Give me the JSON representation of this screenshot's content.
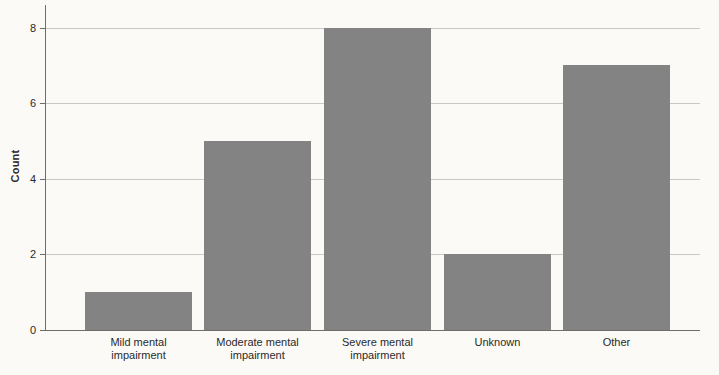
{
  "chart_data": {
    "type": "bar",
    "title": "",
    "xlabel": "",
    "ylabel": "Count",
    "categories": [
      "Mild mental impairment",
      "Moderate mental impairment",
      "Severe mental impairment",
      "Unknown",
      "Other"
    ],
    "category_lines": [
      [
        "Mild mental",
        "impairment"
      ],
      [
        "Moderate mental",
        "impairment"
      ],
      [
        "Severe mental",
        "impairment"
      ],
      [
        "Unknown"
      ],
      [
        "Other"
      ]
    ],
    "values": [
      1,
      5,
      8,
      2,
      7
    ],
    "ylim": [
      0,
      8.6
    ],
    "yticks": [
      0,
      2,
      4,
      6,
      8
    ],
    "ytick_labels": [
      "0",
      "2",
      "4",
      "6",
      "8"
    ],
    "grid": "horizontal",
    "legend": "none",
    "colors": {
      "bar": "#838383",
      "background": "#fbfaf6",
      "axis": "#6f6e6a",
      "grid": "#c9c8c2",
      "text": "#2a2a2a"
    }
  }
}
